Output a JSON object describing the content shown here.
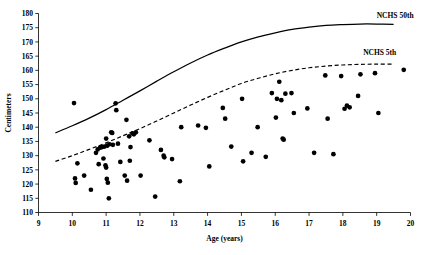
{
  "chart_data": {
    "type": "scatter",
    "title": "",
    "xlabel": "Age (years)",
    "ylabel": "Centimeters",
    "xlim": [
      9,
      20
    ],
    "ylim": [
      110,
      180
    ],
    "xticks": [
      9,
      10,
      11,
      12,
      13,
      14,
      15,
      16,
      17,
      18,
      19,
      20
    ],
    "yticks": [
      110,
      115,
      120,
      125,
      130,
      135,
      140,
      145,
      150,
      155,
      160,
      165,
      170,
      175,
      180
    ],
    "grid": false,
    "legend_position": "inline-right",
    "series": [
      {
        "name": "Observed subjects",
        "type": "scatter",
        "marker": "filled-circle",
        "color": "#000000",
        "points": [
          [
            10.05,
            148.5
          ],
          [
            10.08,
            122.0
          ],
          [
            10.1,
            120.4
          ],
          [
            10.15,
            127.3
          ],
          [
            10.35,
            123.0
          ],
          [
            10.55,
            118.0
          ],
          [
            10.7,
            131.0
          ],
          [
            10.75,
            132.2
          ],
          [
            10.78,
            127.0
          ],
          [
            10.82,
            132.8
          ],
          [
            10.88,
            133.0
          ],
          [
            10.92,
            129.0
          ],
          [
            10.95,
            133.2
          ],
          [
            10.98,
            126.6
          ],
          [
            11.0,
            136.0
          ],
          [
            11.0,
            125.8
          ],
          [
            11.02,
            121.8
          ],
          [
            11.03,
            133.5
          ],
          [
            11.05,
            120.5
          ],
          [
            11.08,
            115.0
          ],
          [
            11.1,
            134.0
          ],
          [
            11.15,
            138.2
          ],
          [
            11.18,
            138.0
          ],
          [
            11.2,
            133.8
          ],
          [
            11.28,
            148.4
          ],
          [
            11.3,
            146.0
          ],
          [
            11.35,
            134.2
          ],
          [
            11.42,
            127.8
          ],
          [
            11.55,
            123.0
          ],
          [
            11.6,
            142.6
          ],
          [
            11.62,
            121.2
          ],
          [
            11.68,
            136.8
          ],
          [
            11.7,
            128.2
          ],
          [
            11.72,
            133.0
          ],
          [
            11.78,
            137.8
          ],
          [
            11.82,
            137.5
          ],
          [
            11.88,
            138.2
          ],
          [
            12.02,
            123.0
          ],
          [
            12.28,
            135.4
          ],
          [
            12.45,
            115.6
          ],
          [
            12.62,
            132.0
          ],
          [
            12.7,
            130.0
          ],
          [
            12.72,
            129.4
          ],
          [
            12.95,
            128.8
          ],
          [
            13.18,
            121.0
          ],
          [
            13.22,
            140.0
          ],
          [
            13.72,
            140.6
          ],
          [
            13.95,
            139.8
          ],
          [
            14.05,
            126.2
          ],
          [
            14.45,
            146.8
          ],
          [
            14.52,
            143.0
          ],
          [
            14.7,
            133.2
          ],
          [
            15.02,
            150.0
          ],
          [
            15.05,
            128.0
          ],
          [
            15.3,
            131.0
          ],
          [
            15.48,
            140.0
          ],
          [
            15.72,
            129.6
          ],
          [
            15.9,
            152.0
          ],
          [
            16.02,
            143.4
          ],
          [
            16.05,
            150.0
          ],
          [
            16.12,
            156.0
          ],
          [
            16.18,
            149.5
          ],
          [
            16.22,
            136.0
          ],
          [
            16.25,
            135.6
          ],
          [
            16.3,
            151.8
          ],
          [
            16.48,
            152.0
          ],
          [
            16.55,
            145.0
          ],
          [
            16.95,
            146.6
          ],
          [
            17.15,
            131.0
          ],
          [
            17.48,
            158.2
          ],
          [
            17.55,
            143.0
          ],
          [
            17.72,
            130.5
          ],
          [
            17.95,
            158.0
          ],
          [
            18.05,
            146.5
          ],
          [
            18.12,
            147.6
          ],
          [
            18.2,
            147.0
          ],
          [
            18.45,
            151.0
          ],
          [
            18.52,
            158.6
          ],
          [
            18.95,
            159.0
          ],
          [
            19.05,
            145.0
          ],
          [
            19.8,
            160.2
          ]
        ]
      },
      {
        "name": "NCHS 50th",
        "type": "line",
        "style": "solid",
        "color": "#000000",
        "points": [
          [
            9.5,
            138.0
          ],
          [
            10.0,
            140.5
          ],
          [
            10.5,
            143.2
          ],
          [
            11.0,
            146.2
          ],
          [
            11.5,
            149.5
          ],
          [
            12.0,
            152.8
          ],
          [
            12.5,
            156.2
          ],
          [
            13.0,
            159.5
          ],
          [
            13.5,
            162.6
          ],
          [
            14.0,
            165.4
          ],
          [
            14.5,
            167.8
          ],
          [
            15.0,
            170.0
          ],
          [
            15.5,
            171.8
          ],
          [
            16.0,
            173.2
          ],
          [
            16.5,
            174.4
          ],
          [
            17.0,
            175.2
          ],
          [
            17.5,
            175.8
          ],
          [
            18.0,
            176.1
          ],
          [
            18.5,
            176.3
          ],
          [
            19.0,
            176.3
          ],
          [
            19.5,
            176.2
          ]
        ]
      },
      {
        "name": "NCHS 5th",
        "type": "line",
        "style": "dashed",
        "color": "#000000",
        "points": [
          [
            9.5,
            128.0
          ],
          [
            10.0,
            130.0
          ],
          [
            10.5,
            132.2
          ],
          [
            11.0,
            134.5
          ],
          [
            11.5,
            137.0
          ],
          [
            12.0,
            139.5
          ],
          [
            12.5,
            142.2
          ],
          [
            13.0,
            145.0
          ],
          [
            13.5,
            147.8
          ],
          [
            14.0,
            150.5
          ],
          [
            14.5,
            153.0
          ],
          [
            15.0,
            155.4
          ],
          [
            15.5,
            157.2
          ],
          [
            16.0,
            158.8
          ],
          [
            16.5,
            160.0
          ],
          [
            17.0,
            160.9
          ],
          [
            17.5,
            161.5
          ],
          [
            18.0,
            161.9
          ],
          [
            18.5,
            162.1
          ],
          [
            19.0,
            162.2
          ],
          [
            19.5,
            162.2
          ]
        ]
      }
    ],
    "annotations": [
      {
        "text": "NCHS 50th",
        "x": 19.0,
        "y": 178.5,
        "anchor": "start"
      },
      {
        "text": "NCHS 5th",
        "x": 18.6,
        "y": 165.5,
        "anchor": "start"
      }
    ]
  }
}
